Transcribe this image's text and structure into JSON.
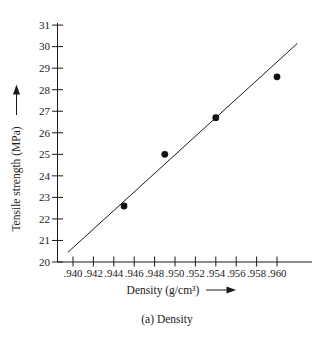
{
  "figure": {
    "background": "#ffffff",
    "ink_color": "#1a1a1a",
    "point_color": "#111111"
  },
  "chart_data": {
    "type": "scatter",
    "title": "",
    "xlabel": "Density (g/cm³)",
    "ylabel": "Tensile strength (MPa)",
    "caption": "(a) Density",
    "x_tick_labels": [
      ".940",
      ".942",
      ".944",
      ".946",
      ".948",
      ".950",
      ".952",
      ".954",
      ".956",
      ".958",
      ".960"
    ],
    "x_tick_values": [
      0.94,
      0.942,
      0.944,
      0.946,
      0.948,
      0.95,
      0.952,
      0.954,
      0.956,
      0.958,
      0.96
    ],
    "y_ticks": [
      20,
      21,
      22,
      23,
      24,
      25,
      26,
      27,
      28,
      29,
      30,
      31
    ],
    "xlim": [
      0.94,
      0.96
    ],
    "ylim": [
      20,
      31
    ],
    "grid": false,
    "legend": null,
    "points": [
      {
        "x": 0.945,
        "y": 22.6
      },
      {
        "x": 0.949,
        "y": 25.0
      },
      {
        "x": 0.954,
        "y": 26.7
      },
      {
        "x": 0.96,
        "y": 28.6
      }
    ],
    "trend_line": {
      "x1": 0.9395,
      "y1": 20.45,
      "x2": 0.962,
      "y2": 30.15
    }
  }
}
